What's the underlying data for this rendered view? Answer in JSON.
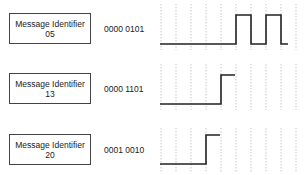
{
  "diagram": {
    "title": "",
    "rows": [
      {
        "box_label": "Message Identifier",
        "id": "05",
        "bits": "0000 0101"
      },
      {
        "box_label": "Message Identifier",
        "id": "13",
        "bits": "0000 1101"
      },
      {
        "box_label": "Message Identifier",
        "id": "20",
        "bits": "0001 0010"
      }
    ],
    "colors": {
      "line": "#222222",
      "grid": "#bbbbbb",
      "box_border": "#444444"
    }
  }
}
